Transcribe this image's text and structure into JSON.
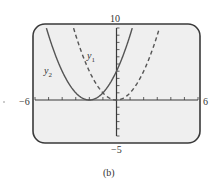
{
  "figure": {
    "caption": "(b)",
    "window": {
      "xmin_label": "−6",
      "xmax_label": "6",
      "ymax_label": "10",
      "ymin_label": "−5"
    },
    "labels": {
      "y1": "y",
      "y1_sub": "1",
      "y2": "y",
      "y2_sub": "2"
    },
    "colors": {
      "frame_fill": "#efefef",
      "frame_stroke": "#3a3a3a",
      "axis": "#3a3a3a",
      "curve": "#555555"
    }
  },
  "chart_data": {
    "type": "line",
    "title": "",
    "caption": "(b)",
    "xlabel": "",
    "ylabel": "",
    "xlim": [
      -6,
      6
    ],
    "ylim": [
      -5,
      10
    ],
    "xscale_ticks": 1,
    "yscale_ticks": 1,
    "grid": false,
    "legend": "inline labels",
    "series": [
      {
        "name": "y1",
        "style": "dashed",
        "expression": "x^2",
        "x": [
          -3.16,
          -3,
          -2,
          -1,
          0,
          1,
          2,
          3,
          3.16
        ],
        "y": [
          10,
          9,
          4,
          1,
          0,
          1,
          4,
          9,
          10
        ]
      },
      {
        "name": "y2",
        "style": "solid",
        "expression": "(x+2)^2",
        "x": [
          -5.16,
          -5,
          -4,
          -3,
          -2,
          -1,
          0,
          1,
          1.16
        ],
        "y": [
          10,
          9,
          4,
          1,
          0,
          1,
          4,
          9,
          10
        ]
      }
    ]
  }
}
